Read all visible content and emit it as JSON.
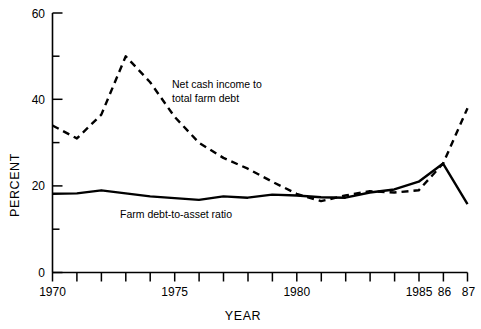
{
  "chart_data": {
    "type": "line",
    "title": "",
    "xlabel": "YEAR",
    "ylabel": "PERCENT",
    "xlim": [
      1970,
      1987
    ],
    "ylim": [
      0,
      60
    ],
    "grid": false,
    "legend_position": "inline-annotation",
    "x": [
      1970,
      1971,
      1972,
      1973,
      1974,
      1975,
      1976,
      1977,
      1978,
      1979,
      1980,
      1981,
      1982,
      1983,
      1984,
      1985,
      1986,
      1987
    ],
    "x_tick_labels": [
      "1970",
      "",
      "",
      "",
      "",
      "1975",
      "",
      "",
      "",
      "",
      "1980",
      "",
      "",
      "",
      "",
      "1985",
      "86",
      "87"
    ],
    "x_major_ticks": [
      1970,
      1975,
      1980,
      1985,
      1986,
      1987
    ],
    "y_major_ticks": [
      0,
      20,
      40,
      60
    ],
    "y_minor_ticks": [
      10,
      30,
      50
    ],
    "y_tick_labels": [
      "0",
      "20",
      "40",
      "60"
    ],
    "series": [
      {
        "name": "Net cash income to total farm debt",
        "style": "dashed",
        "label_text_line1": "Net cash income to",
        "label_text_line2": "total farm debt",
        "values": [
          34.0,
          31.0,
          36.5,
          50.0,
          44.0,
          36.0,
          30.0,
          26.5,
          24.0,
          21.0,
          18.2,
          16.5,
          17.8,
          18.8,
          18.5,
          19.0,
          25.2,
          38.0
        ]
      },
      {
        "name": "Farm debt-to-asset ratio",
        "style": "solid",
        "label_text_line1": "Farm debt-to-asset ratio",
        "values": [
          18.2,
          18.3,
          19.0,
          18.3,
          17.6,
          17.2,
          16.8,
          17.6,
          17.3,
          18.0,
          17.8,
          17.4,
          17.3,
          18.5,
          19.2,
          21.0,
          25.2,
          22.8
        ]
      }
    ],
    "series_end_override": {
      "Farm debt-to-asset ratio": {
        "1987": 15.8
      }
    },
    "colors": {
      "line": "#000000",
      "background": "#ffffff",
      "text": "#000000"
    }
  },
  "axis": {
    "y_title": "PERCENT",
    "x_title": "YEAR",
    "y_labels": [
      "60",
      "40",
      "20",
      "0"
    ],
    "x_labels": [
      "1970",
      "1975",
      "1980",
      "1985",
      "86",
      "87"
    ]
  },
  "annotations": {
    "dashed_label_line1": "Net cash income to",
    "dashed_label_line2": "total farm debt",
    "solid_label": "Farm debt-to-asset ratio"
  }
}
